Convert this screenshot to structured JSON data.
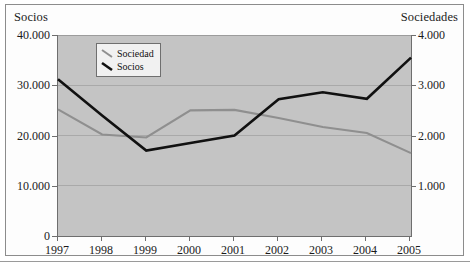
{
  "figure": {
    "left_axis_title": "Socios",
    "right_axis_title": "Sociedades"
  },
  "legend": {
    "items": [
      {
        "label": "Sociedad",
        "color": "#8f8f8f",
        "icon": "line-swatch-icon"
      },
      {
        "label": "Socios",
        "color": "#111111",
        "icon": "line-swatch-icon"
      }
    ]
  },
  "axes": {
    "left_ticks": [
      "40.000",
      "30.000",
      "20.000",
      "10.000",
      "0"
    ],
    "right_ticks": [
      "4.000",
      "3.000",
      "2.000",
      "1.000"
    ],
    "x_ticks": [
      "1997",
      "1998",
      "1999",
      "2000",
      "2001",
      "2002",
      "2003",
      "2004",
      "2005"
    ]
  },
  "chart_data": {
    "type": "line",
    "title": "",
    "subtitle": "",
    "xlabel": "",
    "ylabel": "Socios",
    "y2label": "Sociedades",
    "categories": [
      "1997",
      "1998",
      "1999",
      "2000",
      "2001",
      "2002",
      "2003",
      "2004",
      "2005"
    ],
    "series": [
      {
        "name": "Socios",
        "axis": "left",
        "color": "#111111",
        "values": [
          31200,
          24000,
          17000,
          18500,
          20000,
          27200,
          28600,
          27300,
          35500
        ]
      },
      {
        "name": "Sociedad",
        "axis": "right",
        "color": "#8f8f8f",
        "values": [
          2520,
          2020,
          1960,
          2500,
          2510,
          2350,
          2170,
          2050,
          1650
        ]
      }
    ],
    "ylim": [
      0,
      40000
    ],
    "y2lim": [
      0,
      4000
    ],
    "ytick_values": [
      0,
      10000,
      20000,
      30000,
      40000
    ],
    "y2tick_values": [
      0,
      1000,
      2000,
      3000,
      4000
    ],
    "grid": true,
    "legend_position": "upper-left-inside",
    "plot_background": "#c4c4c4"
  }
}
